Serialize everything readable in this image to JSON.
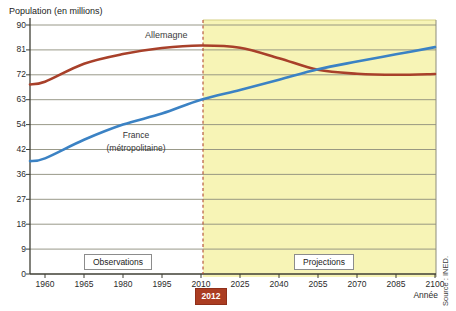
{
  "figure": {
    "axis_title": "Population (en millions)",
    "x_axis_unit": "Année",
    "source": "Source : INED.",
    "observations_label": "Observations",
    "projections_label": "Projections",
    "divider_year": "2012",
    "germany_label": "Allemagne",
    "france_label_line1": "France",
    "france_label_line2": "(métropolitaine)"
  },
  "chart_data": {
    "type": "line",
    "title": "",
    "ylabel": "Population (en millions)",
    "xlabel": "Année",
    "ylim": [
      0,
      90
    ],
    "grid": true,
    "x_tick_labels": [
      "1960",
      "1965",
      "1980",
      "1995",
      "2010",
      "2025",
      "2040",
      "2055",
      "2070",
      "2085",
      "2100"
    ],
    "y_tick_labels": [
      "90",
      "81",
      "72",
      "63",
      "54",
      "42",
      "36",
      "27",
      "18",
      "9",
      "0"
    ],
    "projection_zone": {
      "start_label": "2012",
      "style": "yellow shaded band with dashed left edge",
      "annotation_left": "Observations",
      "annotation_right": "Projections"
    },
    "series": [
      {
        "name": "Allemagne",
        "color": "#a8402a",
        "values": [
          69.5,
          76,
          79.5,
          81.7,
          82.6,
          81.8,
          78,
          73.8,
          72.4,
          72,
          72.3
        ]
      },
      {
        "name": "France (métropolitaine)",
        "color": "#3b82c4",
        "values": [
          41.8,
          48.5,
          54,
          58,
          63,
          66.5,
          70.2,
          74,
          76.8,
          79.4,
          82
        ]
      }
    ],
    "legend_position": "on-curve"
  },
  "colors": {
    "projection_fill": "#f7f4b6",
    "projection_top_edge": "#d5cf82",
    "gridline": "#8d8d7c",
    "axis": "#3f3f35",
    "dashed_divider": "#b14a30",
    "badge_bg": "#ab3d22",
    "badge_text": "#ffffff"
  }
}
